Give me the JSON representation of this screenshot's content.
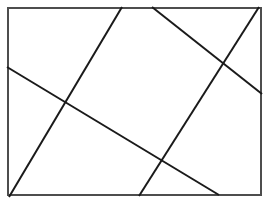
{
  "figure": {
    "canvas": {
      "width": 269,
      "height": 205,
      "background": "#ffffff"
    },
    "colors": {
      "ink": "#1a1a1a",
      "frame_stroke": "#4d4d4d",
      "paper": "#ffffff"
    },
    "frame": {
      "label": "rectangular border",
      "x": 8,
      "y": 8,
      "width": 253,
      "height": 187,
      "stroke_width": 2
    },
    "lines": [
      {
        "label": "line-upper-left-descending",
        "x1": 7,
        "y1": 67,
        "x2": 219,
        "y2": 195,
        "stroke_width": 2
      },
      {
        "label": "line-left-steep-ascending",
        "x1": 9,
        "y1": 197,
        "x2": 122,
        "y2": 7,
        "stroke_width": 2
      },
      {
        "label": "line-top-right-descending",
        "x1": 152,
        "y1": 7,
        "x2": 262,
        "y2": 94,
        "stroke_width": 2
      },
      {
        "label": "line-right-steep-ascending",
        "x1": 139,
        "y1": 196,
        "x2": 259,
        "y2": 7,
        "stroke_width": 2
      }
    ],
    "intersections": [
      {
        "label": "intersection-left",
        "x": 68,
        "y": 100
      },
      {
        "label": "intersection-top-right",
        "x": 222,
        "y": 67
      },
      {
        "label": "intersection-bottom",
        "x": 165,
        "y": 163
      },
      {
        "label": "intersection-top",
        "x": 137,
        "y": 32
      }
    ]
  }
}
